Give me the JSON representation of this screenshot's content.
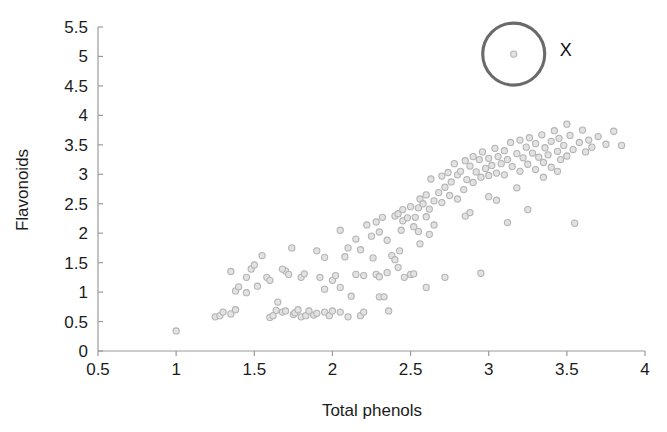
{
  "chart_data": {
    "type": "scatter",
    "title": "",
    "xlabel": "Total phenols",
    "ylabel": "Flavonoids",
    "xlim": [
      0.5,
      4.0
    ],
    "ylim": [
      0.0,
      5.5
    ],
    "xticks": [
      "0.5",
      "1",
      "1.5",
      "2",
      "2.5",
      "3",
      "3.5",
      "4"
    ],
    "xtick_values": [
      0.5,
      1,
      1.5,
      2,
      2.5,
      3,
      3.5,
      4
    ],
    "yticks": [
      "0",
      "0.5",
      "1",
      "1.5",
      "2",
      "2.5",
      "3",
      "3.5",
      "4",
      "4.5",
      "5",
      "5.5"
    ],
    "ytick_values": [
      0,
      0.5,
      1,
      1.5,
      2,
      2.5,
      3,
      3.5,
      4,
      4.5,
      5,
      5.5
    ],
    "grid": false,
    "legend": null,
    "marker": {
      "shape": "circle",
      "radius_px": 3.1,
      "fill_color": "#e2e2e2",
      "edge_color": "#b4b4b4"
    },
    "axis_color": "#9a9a9a",
    "text_color": "#1c1c1c",
    "background": "#ffffff",
    "annotations": [
      {
        "type": "circle-highlight",
        "label": "X",
        "label_color": "#101010",
        "center": [
          3.16,
          5.04
        ],
        "radius_px": 31,
        "stroke_color": "#6a6a6a",
        "label_offset_px": [
          52,
          2
        ]
      }
    ],
    "points": [
      [
        1.0,
        0.34
      ],
      [
        1.25,
        0.58
      ],
      [
        1.28,
        0.6
      ],
      [
        1.3,
        0.66
      ],
      [
        1.35,
        0.63
      ],
      [
        1.38,
        0.7
      ],
      [
        1.38,
        1.02
      ],
      [
        1.4,
        1.09
      ],
      [
        1.45,
        1.25
      ],
      [
        1.48,
        1.39
      ],
      [
        1.5,
        1.46
      ],
      [
        1.55,
        1.62
      ],
      [
        1.58,
        1.25
      ],
      [
        1.6,
        0.57
      ],
      [
        1.62,
        0.6
      ],
      [
        1.64,
        0.69
      ],
      [
        1.65,
        0.83
      ],
      [
        1.68,
        0.66
      ],
      [
        1.7,
        0.68
      ],
      [
        1.7,
        1.36
      ],
      [
        1.72,
        1.3
      ],
      [
        1.74,
        1.75
      ],
      [
        1.75,
        0.62
      ],
      [
        1.76,
        0.65
      ],
      [
        1.78,
        0.7
      ],
      [
        1.8,
        0.58
      ],
      [
        1.8,
        1.25
      ],
      [
        1.82,
        1.31
      ],
      [
        1.83,
        0.6
      ],
      [
        1.85,
        0.68
      ],
      [
        1.88,
        0.61
      ],
      [
        1.9,
        0.64
      ],
      [
        1.9,
        1.7
      ],
      [
        1.92,
        1.25
      ],
      [
        1.95,
        0.66
      ],
      [
        1.95,
        1.59
      ],
      [
        1.98,
        0.6
      ],
      [
        2.0,
        0.68
      ],
      [
        2.0,
        1.2
      ],
      [
        2.02,
        1.28
      ],
      [
        2.05,
        0.66
      ],
      [
        2.05,
        2.05
      ],
      [
        2.1,
        0.58
      ],
      [
        2.1,
        1.75
      ],
      [
        2.15,
        1.9
      ],
      [
        2.18,
        0.6
      ],
      [
        2.2,
        0.66
      ],
      [
        2.2,
        1.28
      ],
      [
        2.22,
        2.14
      ],
      [
        2.25,
        1.95
      ],
      [
        2.28,
        1.3
      ],
      [
        2.3,
        0.92
      ],
      [
        2.3,
        1.26
      ],
      [
        2.32,
        2.27
      ],
      [
        2.35,
        1.33
      ],
      [
        2.36,
        0.68
      ],
      [
        2.38,
        1.62
      ],
      [
        2.4,
        2.29
      ],
      [
        2.42,
        2.33
      ],
      [
        2.43,
        1.7
      ],
      [
        2.45,
        2.4
      ],
      [
        2.45,
        2.21
      ],
      [
        2.48,
        2.26
      ],
      [
        2.5,
        2.45
      ],
      [
        2.5,
        1.3
      ],
      [
        2.52,
        2.11
      ],
      [
        2.53,
        2.27
      ],
      [
        2.55,
        2.43
      ],
      [
        2.55,
        2.03
      ],
      [
        2.56,
        2.58
      ],
      [
        2.58,
        2.5
      ],
      [
        2.6,
        2.65
      ],
      [
        2.6,
        2.28
      ],
      [
        2.62,
        2.41
      ],
      [
        2.63,
        2.92
      ],
      [
        2.65,
        2.55
      ],
      [
        2.65,
        2.14
      ],
      [
        2.68,
        2.69
      ],
      [
        2.7,
        2.97
      ],
      [
        2.7,
        2.52
      ],
      [
        2.72,
        2.78
      ],
      [
        2.74,
        3.03
      ],
      [
        2.75,
        2.64
      ],
      [
        2.76,
        2.87
      ],
      [
        2.78,
        3.18
      ],
      [
        2.8,
        2.99
      ],
      [
        2.8,
        2.58
      ],
      [
        2.82,
        3.05
      ],
      [
        2.84,
        2.74
      ],
      [
        2.85,
        3.23
      ],
      [
        2.86,
        2.91
      ],
      [
        2.88,
        3.14
      ],
      [
        2.9,
        3.3
      ],
      [
        2.9,
        2.86
      ],
      [
        2.92,
        3.04
      ],
      [
        2.94,
        3.25
      ],
      [
        2.95,
        2.95
      ],
      [
        2.96,
        3.38
      ],
      [
        2.98,
        3.1
      ],
      [
        3.0,
        3.27
      ],
      [
        3.0,
        2.98
      ],
      [
        3.02,
        3.15
      ],
      [
        3.04,
        3.44
      ],
      [
        3.05,
        3.02
      ],
      [
        3.06,
        3.3
      ],
      [
        3.08,
        3.18
      ],
      [
        3.1,
        3.4
      ],
      [
        3.1,
        2.99
      ],
      [
        3.12,
        3.25
      ],
      [
        3.14,
        3.54
      ],
      [
        3.15,
        3.13
      ],
      [
        3.16,
        5.04
      ],
      [
        3.18,
        3.35
      ],
      [
        3.2,
        3.58
      ],
      [
        3.2,
        3.05
      ],
      [
        3.22,
        3.28
      ],
      [
        3.24,
        3.46
      ],
      [
        3.25,
        3.17
      ],
      [
        3.26,
        3.62
      ],
      [
        3.28,
        3.36
      ],
      [
        3.3,
        3.52
      ],
      [
        3.3,
        3.08
      ],
      [
        3.32,
        3.29
      ],
      [
        3.34,
        3.67
      ],
      [
        3.35,
        3.2
      ],
      [
        3.36,
        3.45
      ],
      [
        3.38,
        3.33
      ],
      [
        3.4,
        3.56
      ],
      [
        3.4,
        3.12
      ],
      [
        3.42,
        3.74
      ],
      [
        3.44,
        3.39
      ],
      [
        3.45,
        3.61
      ],
      [
        3.46,
        3.25
      ],
      [
        3.48,
        3.49
      ],
      [
        3.5,
        3.85
      ],
      [
        3.5,
        3.31
      ],
      [
        3.52,
        3.66
      ],
      [
        3.54,
        3.42
      ],
      [
        3.55,
        2.17
      ],
      [
        3.58,
        3.54
      ],
      [
        3.6,
        3.75
      ],
      [
        3.62,
        3.38
      ],
      [
        3.64,
        3.58
      ],
      [
        3.66,
        3.46
      ],
      [
        3.7,
        3.64
      ],
      [
        3.75,
        3.51
      ],
      [
        3.8,
        3.73
      ],
      [
        3.85,
        3.49
      ],
      [
        2.05,
        1.08
      ],
      [
        2.15,
        1.3
      ],
      [
        2.28,
        2.19
      ],
      [
        2.33,
        0.92
      ],
      [
        2.4,
        1.55
      ],
      [
        2.46,
        1.25
      ],
      [
        2.52,
        1.31
      ],
      [
        2.6,
        1.08
      ],
      [
        2.72,
        1.25
      ],
      [
        2.85,
        2.29
      ],
      [
        2.95,
        1.32
      ],
      [
        3.05,
        2.56
      ],
      [
        3.12,
        2.18
      ],
      [
        3.18,
        2.77
      ],
      [
        3.25,
        2.4
      ],
      [
        1.45,
        0.99
      ],
      [
        1.52,
        1.1
      ],
      [
        1.6,
        1.2
      ],
      [
        1.68,
        1.39
      ],
      [
        1.35,
        1.35
      ],
      [
        2.08,
        1.6
      ],
      [
        2.18,
        1.72
      ],
      [
        2.26,
        1.58
      ],
      [
        2.35,
        1.88
      ],
      [
        2.42,
        1.42
      ],
      [
        2.62,
        1.98
      ],
      [
        2.88,
        2.35
      ],
      [
        3.0,
        2.62
      ],
      [
        3.35,
        2.95
      ],
      [
        3.44,
        3.05
      ],
      [
        1.95,
        1.05
      ],
      [
        2.12,
        0.93
      ],
      [
        2.3,
        2.02
      ],
      [
        2.44,
        2.05
      ],
      [
        2.56,
        1.82
      ]
    ]
  }
}
